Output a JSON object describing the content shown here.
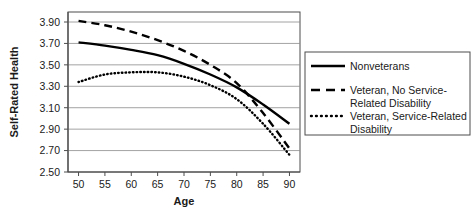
{
  "chart_data": {
    "type": "line",
    "title": "",
    "xlabel": "Age",
    "ylabel": "Self-Rated Health",
    "xlim": [
      48,
      92
    ],
    "ylim": [
      2.5,
      3.9
    ],
    "x_ticks": [
      50,
      55,
      60,
      65,
      70,
      75,
      80,
      85,
      90
    ],
    "y_ticks": [
      "3.90",
      "3.70",
      "3.50",
      "3.30",
      "3.10",
      "2.90",
      "2.70",
      "2.50"
    ],
    "grid": "horizontal",
    "legend_position": "right-outside",
    "x": [
      50,
      55,
      60,
      65,
      70,
      75,
      80,
      85,
      90
    ],
    "series": [
      {
        "name": "Nonveterans",
        "style": "solid",
        "color": "#000000",
        "values": [
          3.71,
          3.68,
          3.64,
          3.59,
          3.51,
          3.41,
          3.29,
          3.13,
          2.95
        ]
      },
      {
        "name": "Veteran, No Service-Related Disability",
        "style": "dashed",
        "color": "#000000",
        "values": [
          3.91,
          3.87,
          3.81,
          3.73,
          3.63,
          3.5,
          3.33,
          3.05,
          2.72
        ]
      },
      {
        "name": "Veteran, Service-Related Disability",
        "style": "dotted",
        "color": "#000000",
        "values": [
          3.34,
          3.41,
          3.43,
          3.43,
          3.39,
          3.31,
          3.18,
          2.95,
          2.66
        ]
      }
    ]
  },
  "legend": {
    "entries": [
      {
        "label": "Nonveterans",
        "line2": ""
      },
      {
        "label": "Veteran, No Service-",
        "line2": "Related Disability"
      },
      {
        "label": "Veteran, Service-Related",
        "line2": "Disability"
      }
    ]
  },
  "axes": {
    "x_title": "Age",
    "y_title": "Self-Rated Health"
  }
}
